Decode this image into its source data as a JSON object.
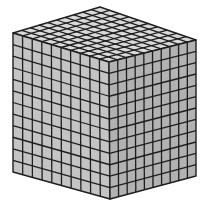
{
  "figure": {
    "title": "Cube made of unit cubes",
    "alt": "Isometric drawing of a large cube subdivided into a grid of small unit cubes",
    "grid": {
      "top_cols": 10,
      "top_rows": 10,
      "side_cols": 10,
      "side_rows": 12
    },
    "colors": {
      "top": "#d9d9d9",
      "left": "#c4c4c4",
      "right": "#b2b2b2",
      "line": "#1e1e1e",
      "background": "#ffffff"
    },
    "vertices": {
      "top_back": [
        100,
        7
      ],
      "top_left": [
        13,
        33
      ],
      "top_front": [
        109,
        62
      ],
      "top_right": [
        196,
        40
      ],
      "bottom_left": [
        13,
        172
      ],
      "bottom_front": [
        110,
        199
      ],
      "bottom_right": [
        196,
        176
      ]
    }
  }
}
